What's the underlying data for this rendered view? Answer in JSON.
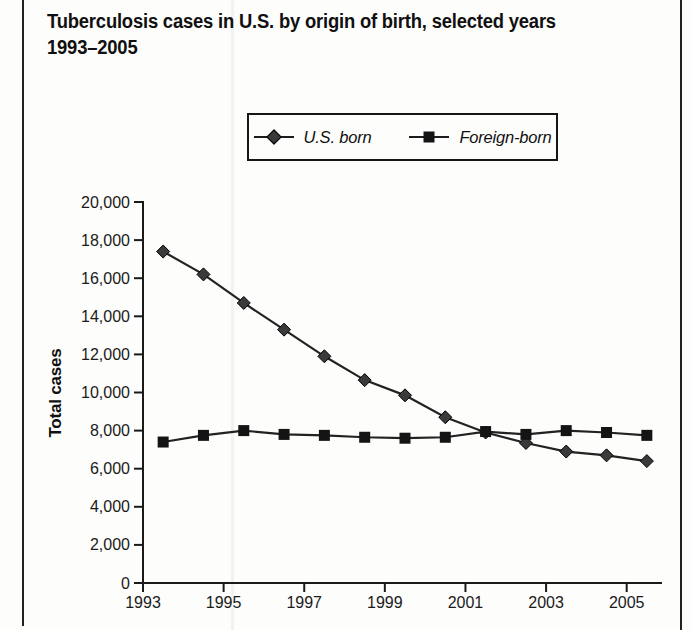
{
  "title": {
    "line1": "Tuberculosis cases in U.S. by origin of birth, selected years",
    "line2": "1993–2005"
  },
  "colors": {
    "axis": "#1a1a1a",
    "text": "#111111",
    "background": "#fdfdfc",
    "us_born_marker": "#3a3a3a",
    "foreign_born_marker": "#141414",
    "line": "#222222"
  },
  "chart_data": {
    "type": "line",
    "title": "Tuberculosis cases in U.S. by origin of birth, selected years 1993–2005",
    "ylabel": "Total cases",
    "xlabel": "",
    "ylim": [
      0,
      20000
    ],
    "y_tick_step": 2000,
    "y_tick_labels": [
      "0",
      "2,000",
      "4,000",
      "6,000",
      "8,000",
      "10,000",
      "12,000",
      "14,000",
      "16,000",
      "18,000",
      "20,000"
    ],
    "categories": [
      1993,
      1994,
      1995,
      1996,
      1997,
      1998,
      1999,
      2000,
      2001,
      2002,
      2003,
      2004,
      2005
    ],
    "x_tick_labels": [
      "1993",
      "1995",
      "1997",
      "1999",
      "2001",
      "2003",
      "2005"
    ],
    "grid": false,
    "legend_position": "top-center",
    "series": [
      {
        "name": "U.S. born",
        "marker": "diamond",
        "color": "#3a3a3a",
        "values": [
          17400,
          16200,
          14700,
          13300,
          11900,
          10650,
          9850,
          8700,
          7900,
          7350,
          6900,
          6700,
          6400
        ]
      },
      {
        "name": "Foreign-born",
        "marker": "square",
        "color": "#141414",
        "values": [
          7400,
          7750,
          8000,
          7800,
          7750,
          7650,
          7600,
          7650,
          7950,
          7800,
          8000,
          7900,
          7750
        ]
      }
    ]
  }
}
